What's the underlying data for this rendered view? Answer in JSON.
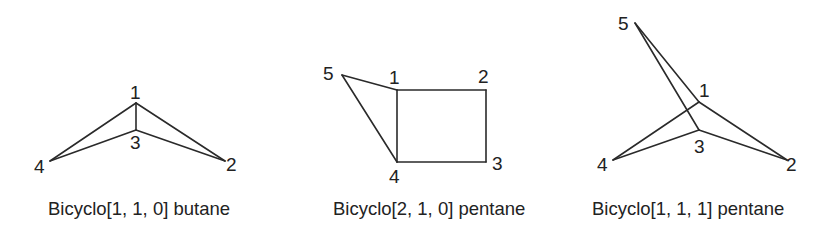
{
  "figure": {
    "background": "#ffffff",
    "line_color": "#2a2a2a",
    "text_color": "#222222"
  },
  "structures": [
    {
      "name": "bicyclo-1-1-0-butane",
      "caption": "Bicyclo[1, 1, 0] butane",
      "atoms": [
        {
          "label": "1",
          "x": 136,
          "y": 103
        },
        {
          "label": "2",
          "x": 225,
          "y": 161
        },
        {
          "label": "3",
          "x": 136,
          "y": 130
        },
        {
          "label": "4",
          "x": 50,
          "y": 161
        }
      ],
      "bonds": [
        [
          "1",
          "4"
        ],
        [
          "1",
          "2"
        ],
        [
          "1",
          "3"
        ],
        [
          "3",
          "4"
        ],
        [
          "3",
          "2"
        ]
      ]
    },
    {
      "name": "bicyclo-2-1-0-pentane",
      "caption": "Bicyclo[2, 1, 0] pentane",
      "atoms": [
        {
          "label": "1",
          "x": 397,
          "y": 90
        },
        {
          "label": "2",
          "x": 486,
          "y": 90
        },
        {
          "label": "3",
          "x": 486,
          "y": 162
        },
        {
          "label": "4",
          "x": 397,
          "y": 162
        },
        {
          "label": "5",
          "x": 342,
          "y": 75
        }
      ],
      "bonds": [
        [
          "1",
          "2"
        ],
        [
          "2",
          "3"
        ],
        [
          "3",
          "4"
        ],
        [
          "4",
          "1"
        ],
        [
          "5",
          "1"
        ],
        [
          "5",
          "4"
        ]
      ]
    },
    {
      "name": "bicyclo-1-1-1-pentane",
      "caption": "Bicyclo[1, 1, 1] pentane",
      "atoms": [
        {
          "label": "1",
          "x": 699,
          "y": 102
        },
        {
          "label": "2",
          "x": 787,
          "y": 160
        },
        {
          "label": "3",
          "x": 699,
          "y": 130
        },
        {
          "label": "4",
          "x": 613,
          "y": 160
        },
        {
          "label": "5",
          "x": 635,
          "y": 23
        }
      ],
      "bonds": [
        [
          "5",
          "1"
        ],
        [
          "5",
          "3"
        ],
        [
          "1",
          "4"
        ],
        [
          "1",
          "2"
        ],
        [
          "3",
          "4"
        ],
        [
          "3",
          "2"
        ]
      ]
    }
  ]
}
